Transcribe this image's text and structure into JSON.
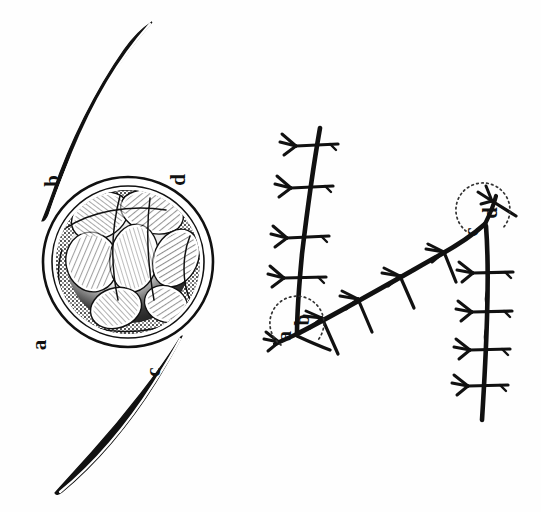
{
  "figure": {
    "background_color": "#fefefe",
    "ink_color": "#111111",
    "width": 541,
    "height": 512
  },
  "left_panel": {
    "name": "oospore-with-crescents",
    "description": "Spherical ornamented oospore flanked by two tapering crescent (sickle) bodies",
    "labels": [
      {
        "key": "a",
        "text": "a",
        "x": 46,
        "y": 345,
        "rotation": -90
      },
      {
        "key": "b",
        "text": "b",
        "x": 59,
        "y": 181,
        "rotation": -90
      },
      {
        "key": "c",
        "text": "c",
        "x": 160,
        "y": 372,
        "rotation": -90
      },
      {
        "key": "d",
        "text": "d",
        "x": 185,
        "y": 180,
        "rotation": -90
      }
    ],
    "spore": {
      "center_x": 128,
      "center_y": 262,
      "outer_radius": 85,
      "inner_radius": 72,
      "wall_thickness": 8
    }
  },
  "right_panel": {
    "name": "branching-hypha-diagram",
    "description": "Septate branching filament bearing lateral spine clusters; dotted arcs mark branch angles",
    "labels": [
      {
        "key": "a",
        "text": "a",
        "x": 291,
        "y": 336,
        "rotation": -90
      },
      {
        "key": "b",
        "text": "b",
        "x": 309,
        "y": 320,
        "rotation": -90
      },
      {
        "key": "c",
        "text": "c",
        "x": 478,
        "y": 232,
        "rotation": -90
      },
      {
        "key": "d",
        "text": "d",
        "x": 497,
        "y": 213,
        "rotation": -90
      }
    ],
    "angle_arcs": [
      {
        "key": "ab",
        "cx": 297,
        "cy": 334,
        "r": 27
      },
      {
        "key": "cd",
        "cx": 485,
        "cy": 222,
        "r": 27
      }
    ],
    "branch_counts": {
      "upper_left_stem": 4,
      "diagonal_stem": 4,
      "right_stem": 6
    }
  },
  "caption": {
    "visible": false,
    "text": ""
  }
}
